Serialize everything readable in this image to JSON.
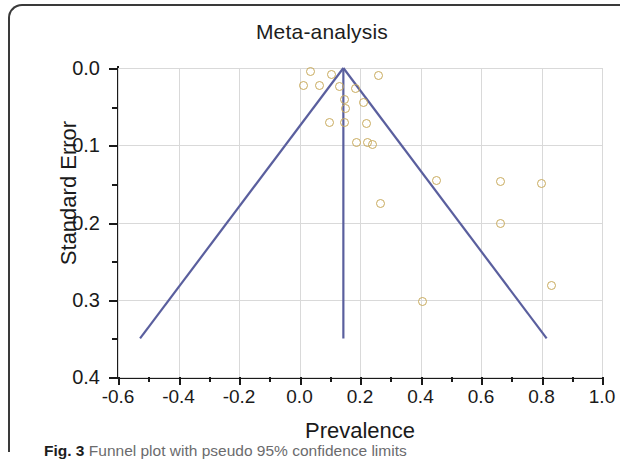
{
  "figure": {
    "caption_label": "Fig. 3",
    "caption_text": "Funnel plot with pseudo 95% confidence limits"
  },
  "colors": {
    "point_stroke": "#c9ab5e",
    "funnel_line": "#5a5f9e",
    "grid": "#d9d9d9",
    "axis": "#1a1a1a",
    "caption": "#6b6b6d"
  },
  "chart_data": {
    "type": "scatter",
    "title": "Meta-analysis",
    "xlabel": "Prevalence",
    "ylabel": "Standard Error",
    "xlim": [
      -0.6,
      1.0
    ],
    "ylim": [
      0.0,
      0.4
    ],
    "y_inverted": true,
    "grid": true,
    "legend": null,
    "xticks": [
      -0.6,
      -0.4,
      -0.2,
      0.0,
      0.2,
      0.4,
      0.6,
      0.8,
      1.0
    ],
    "xtick_labels": [
      "-0.6",
      "-0.4",
      "-0.2",
      "0.0",
      "0.2",
      "0.4",
      "0.6",
      "0.8",
      "1.0"
    ],
    "xticks_minor": [
      -0.5,
      -0.3,
      -0.1,
      0.1,
      0.3,
      0.5,
      0.7,
      0.9
    ],
    "yticks": [
      0.0,
      0.1,
      0.2,
      0.3,
      0.4
    ],
    "ytick_labels": [
      "0.0",
      "0.1",
      "0.2",
      "0.3",
      "0.4"
    ],
    "yticks_minor": [
      0.05,
      0.15,
      0.25,
      0.35
    ],
    "points": [
      {
        "x": 0.035,
        "y": 0.005
      },
      {
        "x": 0.107,
        "y": 0.008
      },
      {
        "x": 0.262,
        "y": 0.01
      },
      {
        "x": 0.012,
        "y": 0.023
      },
      {
        "x": 0.065,
        "y": 0.023
      },
      {
        "x": 0.133,
        "y": 0.024
      },
      {
        "x": 0.185,
        "y": 0.026
      },
      {
        "x": 0.15,
        "y": 0.041
      },
      {
        "x": 0.212,
        "y": 0.045
      },
      {
        "x": 0.152,
        "y": 0.052
      },
      {
        "x": 0.1,
        "y": 0.071
      },
      {
        "x": 0.15,
        "y": 0.071
      },
      {
        "x": 0.222,
        "y": 0.072
      },
      {
        "x": 0.225,
        "y": 0.097
      },
      {
        "x": 0.24,
        "y": 0.099
      },
      {
        "x": 0.19,
        "y": 0.097
      },
      {
        "x": 0.452,
        "y": 0.146
      },
      {
        "x": 0.665,
        "y": 0.147
      },
      {
        "x": 0.8,
        "y": 0.15
      },
      {
        "x": 0.268,
        "y": 0.176
      },
      {
        "x": 0.665,
        "y": 0.201
      },
      {
        "x": 0.832,
        "y": 0.281
      },
      {
        "x": 0.405,
        "y": 0.302
      }
    ],
    "funnel": {
      "apex_x": 0.145,
      "apex_y": 0.0,
      "base_y": 0.35,
      "left_base_x": -0.527,
      "right_base_x": 0.817,
      "center_line_x": 0.145
    }
  }
}
